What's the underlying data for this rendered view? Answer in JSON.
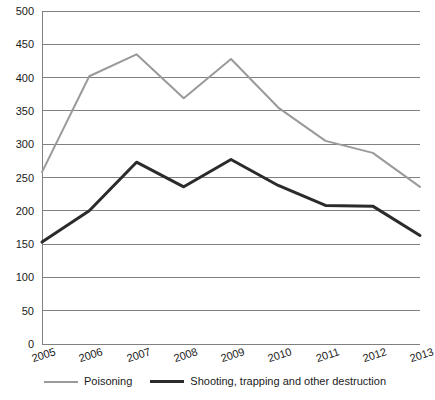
{
  "chart_data": {
    "type": "line",
    "title": "",
    "subtitle": "",
    "xlabel": "",
    "ylabel": "",
    "categories": [
      "2005",
      "2006",
      "2007",
      "2008",
      "2009",
      "2010",
      "2011",
      "2012",
      "2013"
    ],
    "series": [
      {
        "name": "Poisoning",
        "color": "#9a9a9a",
        "line_width": 2,
        "values": [
          258,
          402,
          435,
          369,
          428,
          355,
          305,
          287,
          236
        ]
      },
      {
        "name": "Shooting, trapping and other destruction",
        "color": "#2b2b2b",
        "line_width": 3,
        "values": [
          153,
          200,
          273,
          236,
          277,
          238,
          208,
          207,
          163
        ]
      }
    ],
    "ylim": [
      0,
      500
    ],
    "y_ticks": [
      0,
      50,
      100,
      150,
      200,
      250,
      300,
      350,
      400,
      450,
      500
    ],
    "y_tick_labels": [
      "0",
      "50",
      "100",
      "150",
      "200",
      "250",
      "300",
      "350",
      "400",
      "450",
      "500"
    ],
    "grid": true,
    "grid_axis": "y",
    "grid_color": "#808080",
    "axis_color": "#808080",
    "legend_position": "bottom",
    "x_tick_rotation": -18
  },
  "legend": {
    "entries": [
      {
        "label": "Poisoning",
        "color": "#9a9a9a",
        "weight": "thin"
      },
      {
        "label": "Shooting, trapping and other destruction",
        "color": "#2b2b2b",
        "weight": "thick"
      }
    ]
  }
}
